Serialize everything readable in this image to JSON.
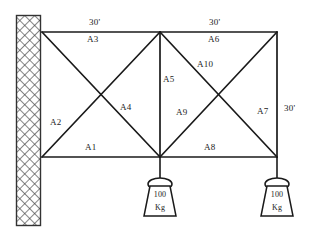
{
  "diagram": {
    "line_color": "#1a1a1a",
    "wall_color": "#555555",
    "background": "#ffffff"
  },
  "dimensions": [
    {
      "id": "top-left-span",
      "label": "30'"
    },
    {
      "id": "top-right-span",
      "label": "30'"
    },
    {
      "id": "right-height",
      "label": "30'"
    }
  ],
  "members": [
    {
      "id": "A1",
      "label": "A1"
    },
    {
      "id": "A2",
      "label": "A2"
    },
    {
      "id": "A3",
      "label": "A3"
    },
    {
      "id": "A4",
      "label": "A4"
    },
    {
      "id": "A5",
      "label": "A5"
    },
    {
      "id": "A6",
      "label": "A6"
    },
    {
      "id": "A7",
      "label": "A7"
    },
    {
      "id": "A8",
      "label": "A8"
    },
    {
      "id": "A9",
      "label": "A9"
    },
    {
      "id": "A10",
      "label": "A10"
    }
  ],
  "loads": [
    {
      "id": "load-middle",
      "value": "100",
      "unit": "Kg"
    },
    {
      "id": "load-right",
      "value": "100",
      "unit": "Kg"
    }
  ]
}
